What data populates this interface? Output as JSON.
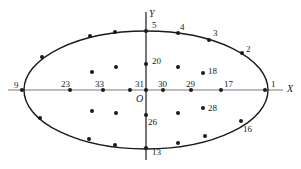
{
  "diagram": {
    "axes": {
      "x_label": "X",
      "y_label": "Y",
      "origin_label": "O"
    },
    "colors": {
      "stroke": "#1a1a1a",
      "background": "#ffffff"
    },
    "ellipse": {
      "cx": 146,
      "cy": 90,
      "rx": 122,
      "ry": 59
    },
    "points": [
      {
        "id": "p1",
        "label": "1",
        "x": 265,
        "y": 90,
        "lx": 271,
        "ly": 80
      },
      {
        "id": "p2",
        "label": "2",
        "x": 242,
        "y": 53,
        "lx": 246,
        "ly": 45
      },
      {
        "id": "p3",
        "label": "3",
        "x": 209,
        "y": 40,
        "lx": 213,
        "ly": 29
      },
      {
        "id": "p4",
        "label": "4",
        "x": 178,
        "y": 33,
        "lx": 180,
        "ly": 23
      },
      {
        "id": "p5",
        "label": "5",
        "x": 146,
        "y": 31,
        "lx": 152,
        "ly": 21
      },
      {
        "id": "p6",
        "label": "",
        "x": 115,
        "y": 32,
        "lx": 0,
        "ly": 0
      },
      {
        "id": "p7",
        "label": "",
        "x": 90,
        "y": 36,
        "lx": 0,
        "ly": 0
      },
      {
        "id": "p8",
        "label": "",
        "x": 42,
        "y": 57,
        "lx": 0,
        "ly": 0
      },
      {
        "id": "p9",
        "label": "9",
        "x": 22,
        "y": 90,
        "lx": 14,
        "ly": 81
      },
      {
        "id": "p10",
        "label": "",
        "x": 40,
        "y": 118,
        "lx": 0,
        "ly": 0
      },
      {
        "id": "p11",
        "label": "",
        "x": 89,
        "y": 139,
        "lx": 0,
        "ly": 0
      },
      {
        "id": "p12",
        "label": "",
        "x": 115,
        "y": 145,
        "lx": 0,
        "ly": 0
      },
      {
        "id": "p13",
        "label": "13",
        "x": 146,
        "y": 148,
        "lx": 152,
        "ly": 148
      },
      {
        "id": "p14",
        "label": "",
        "x": 178,
        "y": 143,
        "lx": 0,
        "ly": 0
      },
      {
        "id": "p15",
        "label": "",
        "x": 205,
        "y": 136,
        "lx": 0,
        "ly": 0
      },
      {
        "id": "p16",
        "label": "16",
        "x": 241,
        "y": 121,
        "lx": 243,
        "ly": 125
      },
      {
        "id": "p17",
        "label": "17",
        "x": 221,
        "y": 90,
        "lx": 224,
        "ly": 80
      },
      {
        "id": "p18",
        "label": "18",
        "x": 203,
        "y": 73,
        "lx": 208,
        "ly": 67
      },
      {
        "id": "p19",
        "label": "",
        "x": 178,
        "y": 67,
        "lx": 0,
        "ly": 0
      },
      {
        "id": "p20",
        "label": "20",
        "x": 146,
        "y": 64,
        "lx": 152,
        "ly": 57
      },
      {
        "id": "p21",
        "label": "",
        "x": 116,
        "y": 67,
        "lx": 0,
        "ly": 0
      },
      {
        "id": "p22",
        "label": "",
        "x": 92,
        "y": 72,
        "lx": 0,
        "ly": 0
      },
      {
        "id": "p23",
        "label": "23",
        "x": 70,
        "y": 90,
        "lx": 61,
        "ly": 80
      },
      {
        "id": "p24",
        "label": "",
        "x": 92,
        "y": 111,
        "lx": 0,
        "ly": 0
      },
      {
        "id": "p25",
        "label": "",
        "x": 116,
        "y": 113,
        "lx": 0,
        "ly": 0
      },
      {
        "id": "p26",
        "label": "26",
        "x": 146,
        "y": 115,
        "lx": 148,
        "ly": 118
      },
      {
        "id": "p27",
        "label": "",
        "x": 178,
        "y": 113,
        "lx": 0,
        "ly": 0
      },
      {
        "id": "p28",
        "label": "28",
        "x": 203,
        "y": 108,
        "lx": 208,
        "ly": 104
      },
      {
        "id": "p29",
        "label": "29",
        "x": 191,
        "y": 90,
        "lx": 186,
        "ly": 80
      },
      {
        "id": "p30",
        "label": "30",
        "x": 163,
        "y": 90,
        "lx": 158,
        "ly": 80
      },
      {
        "id": "p31",
        "label": "31",
        "x": 146,
        "y": 90,
        "lx": 135,
        "ly": 80
      },
      {
        "id": "p32",
        "label": "",
        "x": 130,
        "y": 90,
        "lx": 0,
        "ly": 0
      },
      {
        "id": "p33",
        "label": "33",
        "x": 103,
        "y": 90,
        "lx": 95,
        "ly": 80
      }
    ]
  }
}
